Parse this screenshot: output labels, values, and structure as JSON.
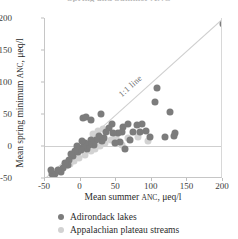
{
  "chart_data": {
    "type": "scatter",
    "title": "Spring and Summer ANC",
    "xlabel": "Mean summer ANC, μeq/l",
    "ylabel": "Mean spring minimum ANC, μeq/l",
    "xlim": [
      -50,
      200
    ],
    "ylim": [
      -50,
      200
    ],
    "xticks": [
      -50,
      0,
      50,
      100,
      150,
      200
    ],
    "yticks": [
      -50,
      0,
      50,
      100,
      150,
      200
    ],
    "grid": false,
    "legend_position": "below-axes",
    "annotations": [
      {
        "text": "1:1 line",
        "kind": "reference-line-label",
        "rotation": -40
      }
    ],
    "reference_lines": [
      {
        "name": "one-to-one",
        "type": "diagonal",
        "from": [
          -50,
          -50
        ],
        "to": [
          200,
          200
        ],
        "color": "#cfcfcf"
      },
      {
        "name": "zero",
        "type": "horizontal",
        "y": 0,
        "color": "#cfcfcf"
      }
    ],
    "series": [
      {
        "name": "Adirondack lakes",
        "color": "#7c7c7c",
        "marker": "circle",
        "points": [
          [
            200,
            190
          ],
          [
            108,
            90
          ],
          [
            104,
            68
          ],
          [
            125,
            53
          ],
          [
            133,
            21
          ],
          [
            131,
            15
          ],
          [
            118,
            14
          ],
          [
            98,
            14
          ],
          [
            86,
            35
          ],
          [
            79,
            33
          ],
          [
            92,
            23
          ],
          [
            83,
            22
          ],
          [
            74,
            22
          ],
          [
            66,
            35
          ],
          [
            60,
            30
          ],
          [
            58,
            22
          ],
          [
            52,
            20
          ],
          [
            46,
            20
          ],
          [
            44,
            34
          ],
          [
            40,
            28
          ],
          [
            36,
            22
          ],
          [
            33,
            13
          ],
          [
            30,
            8
          ],
          [
            26,
            16
          ],
          [
            22,
            10
          ],
          [
            19,
            2
          ],
          [
            15,
            10
          ],
          [
            12,
            2
          ],
          [
            9,
            -4
          ],
          [
            6,
            4
          ],
          [
            3,
            -2
          ],
          [
            2,
            8
          ],
          [
            0,
            -6
          ],
          [
            -3,
            -10
          ],
          [
            -5,
            0
          ],
          [
            -8,
            -8
          ],
          [
            -10,
            -16
          ],
          [
            -13,
            -12
          ],
          [
            -16,
            -22
          ],
          [
            -18,
            -30
          ],
          [
            -22,
            -26
          ],
          [
            -25,
            -34
          ],
          [
            -28,
            -40
          ],
          [
            -32,
            -38
          ],
          [
            -36,
            -44
          ],
          [
            -40,
            -44
          ],
          [
            -42,
            -37
          ],
          [
            3,
            43
          ],
          [
            8,
            46
          ],
          [
            14,
            41
          ],
          [
            28,
            50
          ],
          [
            70,
            9
          ],
          [
            56,
            6
          ],
          [
            48,
            4
          ],
          [
            62,
            -4
          ]
        ]
      },
      {
        "name": "Appalachian plateau streams",
        "color": "#d2d2d2",
        "marker": "circle",
        "points": [
          [
            50,
            14
          ],
          [
            42,
            10
          ],
          [
            34,
            4
          ],
          [
            27,
            0
          ],
          [
            20,
            -4
          ],
          [
            14,
            -8
          ],
          [
            6,
            -14
          ],
          [
            -2,
            -18
          ],
          [
            -9,
            -24
          ],
          [
            -15,
            -28
          ],
          [
            -21,
            -32
          ],
          [
            80,
            14
          ],
          [
            66,
            12
          ],
          [
            58,
            2
          ],
          [
            95,
            8
          ],
          [
            24,
            24
          ],
          [
            31,
            26
          ],
          [
            17,
            18
          ]
        ]
      }
    ]
  },
  "legend": {
    "items": [
      {
        "label": "Adirondack lakes",
        "color": "#7c7c7c"
      },
      {
        "label": "Appalachian plateau streams",
        "color": "#d2d2d2"
      }
    ]
  }
}
